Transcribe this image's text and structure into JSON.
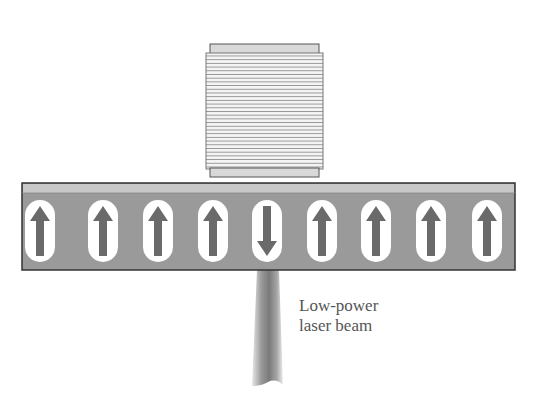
{
  "diagram": {
    "coil": {
      "name": "coil",
      "turns": 34
    },
    "medium": {
      "domains": [
        {
          "index": 0,
          "direction": "up"
        },
        {
          "index": 1,
          "direction": "up"
        },
        {
          "index": 2,
          "direction": "up"
        },
        {
          "index": 3,
          "direction": "up"
        },
        {
          "index": 4,
          "direction": "down"
        },
        {
          "index": 5,
          "direction": "up"
        },
        {
          "index": 6,
          "direction": "up"
        },
        {
          "index": 7,
          "direction": "up"
        },
        {
          "index": 8,
          "direction": "up"
        }
      ]
    },
    "laser": {
      "label_line1": "Low-power",
      "label_line2": "laser beam"
    },
    "colors": {
      "medium": "#9a9a9a",
      "medium_top_strip": "#c8c8c8",
      "arrow": "#6a6a6a",
      "capsule": "#ffffff",
      "outline": "#333333",
      "label": "#555555"
    }
  }
}
